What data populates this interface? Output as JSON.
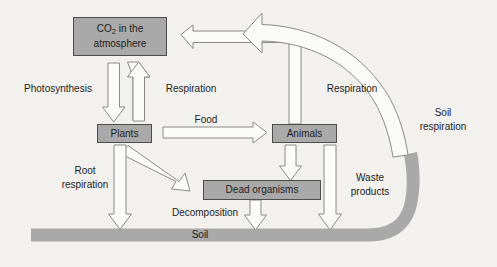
{
  "diagram": {
    "type": "cycle-diagram",
    "colors": {
      "background": "#f2f1ee",
      "box_fill": "#a9a9a9",
      "box_stroke": "#4c4c4c",
      "arrow_fill": "#fbfbf9",
      "arrow_stroke": "#8a8a8a",
      "text": "#1d1d1d"
    },
    "nodes": [
      {
        "id": "atmosphere",
        "label_line1": "CO",
        "label_sub": "2",
        "label_line1b": " in the",
        "label_line2": "atmosphere",
        "label_full": "CO2 in the atmosphere"
      },
      {
        "id": "plants",
        "label": "Plants"
      },
      {
        "id": "animals",
        "label": "Animals"
      },
      {
        "id": "dead_organisms",
        "label": "Dead organisms"
      },
      {
        "id": "soil",
        "label": "Soil"
      }
    ],
    "flows": [
      {
        "id": "photosynthesis",
        "label": "Photosynthesis",
        "from": "atmosphere",
        "to": "plants"
      },
      {
        "id": "respiration_plants",
        "label": "Respiration",
        "from": "plants",
        "to": "atmosphere"
      },
      {
        "id": "respiration_animals",
        "label": "Respiration",
        "from": "animals",
        "to": "atmosphere"
      },
      {
        "id": "soil_respiration",
        "label_line1": "Soil",
        "label_line2": "respiration",
        "label": "Soil respiration",
        "from": "soil",
        "to": "atmosphere"
      },
      {
        "id": "food",
        "label": "Food",
        "from": "plants",
        "to": "animals"
      },
      {
        "id": "root_respiration",
        "label_line1": "Root",
        "label_line2": "respiration",
        "label": "Root respiration",
        "from": "plants",
        "to": "soil"
      },
      {
        "id": "plants_to_dead",
        "label": "",
        "from": "plants",
        "to": "dead_organisms"
      },
      {
        "id": "animals_to_dead",
        "label": "",
        "from": "animals",
        "to": "dead_organisms"
      },
      {
        "id": "decomposition",
        "label": "Decomposition",
        "from": "dead_organisms",
        "to": "soil"
      },
      {
        "id": "waste_products",
        "label_line1": "Waste",
        "label_line2": "products",
        "label": "Waste products",
        "from": "animals",
        "to": "soil"
      }
    ]
  }
}
